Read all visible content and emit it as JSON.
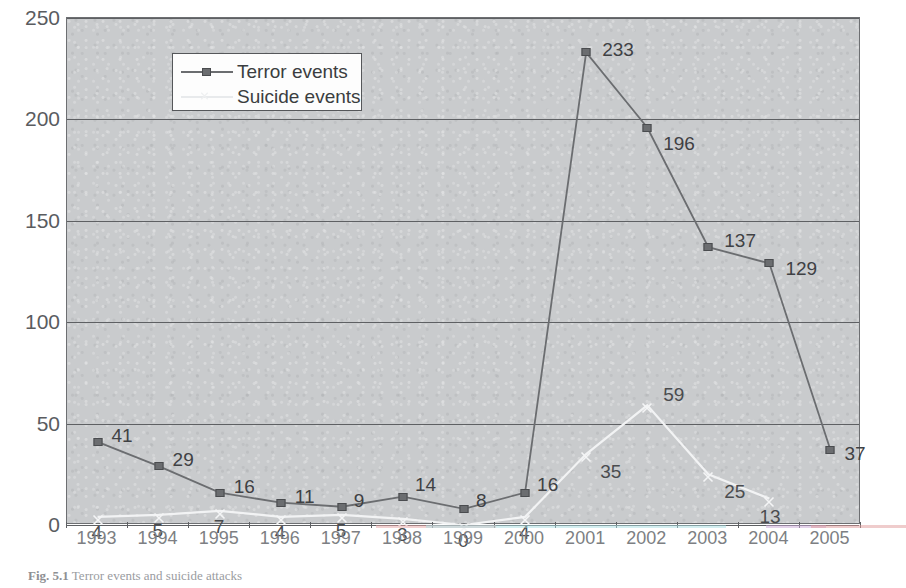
{
  "chart_data": {
    "type": "line",
    "title": "",
    "xlabel": "",
    "ylabel": "",
    "ylim": [
      0,
      250
    ],
    "yticks": [
      0,
      50,
      100,
      150,
      200,
      250
    ],
    "grid": true,
    "legend_position": "upper-left-inside",
    "categories": [
      "1993",
      "1994",
      "1995",
      "1996",
      "1997",
      "1998",
      "1999",
      "2000",
      "2001",
      "2002",
      "2003",
      "2004",
      "2005"
    ],
    "series": [
      {
        "name": "Terror events",
        "marker": "square",
        "color": "#6b6d70",
        "values": [
          41,
          29,
          16,
          11,
          9,
          14,
          8,
          16,
          233,
          196,
          137,
          129,
          37
        ],
        "labels": [
          "41",
          "29",
          "16",
          "11",
          "9",
          "14",
          "8",
          "16",
          "233",
          "196",
          "137",
          "129",
          "37"
        ]
      },
      {
        "name": "Suicide events",
        "marker": "x",
        "color": "#f2f3f4",
        "values": [
          4,
          5,
          7,
          4,
          5,
          3,
          0,
          4,
          35,
          59,
          25,
          13,
          null
        ],
        "labels": [
          "4",
          "5",
          "7",
          "4",
          "5",
          "3",
          "0",
          "4",
          "35",
          "59",
          "25",
          "13",
          ""
        ]
      }
    ]
  },
  "legend": {
    "items": [
      {
        "label": "Terror events"
      },
      {
        "label": "Suicide events"
      }
    ]
  },
  "axes": {
    "y_tick_labels": [
      "250",
      "200",
      "150",
      "100",
      "50",
      "0"
    ],
    "x_tick_labels": [
      "1993",
      "1994",
      "1995",
      "1996",
      "1997",
      "1998",
      "1999",
      "2000",
      "2001",
      "2002",
      "2003",
      "2004",
      "2005"
    ]
  },
  "caption": {
    "figure_number": "Fig. 5.1",
    "text": "Terror events and suicide attacks"
  }
}
